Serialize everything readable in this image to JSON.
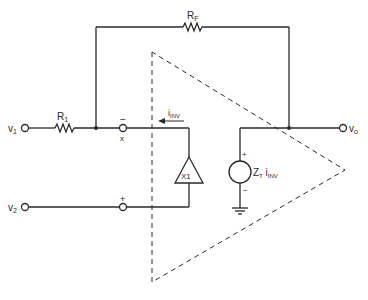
{
  "diagram": {
    "type": "circuit-schematic",
    "colors": {
      "line": "#2a2a2a",
      "background": "#ffffff"
    },
    "terminals": {
      "v1": {
        "base": "v",
        "sub": "1"
      },
      "v2": {
        "base": "v",
        "sub": "2"
      },
      "vo": {
        "base": "v",
        "sub": "o"
      }
    },
    "components": {
      "r1": {
        "base": "R",
        "sub": "1"
      },
      "rf": {
        "base": "R",
        "sub": "F"
      },
      "buffer": {
        "label": "X1"
      },
      "source": {
        "base_z": "Z",
        "sub_t": "T",
        "base_i": " i",
        "sub_inv": "INV",
        "plus": "+",
        "minus": "−"
      }
    },
    "inputs": {
      "inverting": {
        "sign": "−",
        "node": "x"
      },
      "noninverting": {
        "sign": "+"
      }
    },
    "current": {
      "base": "i",
      "sub": "INV"
    }
  }
}
